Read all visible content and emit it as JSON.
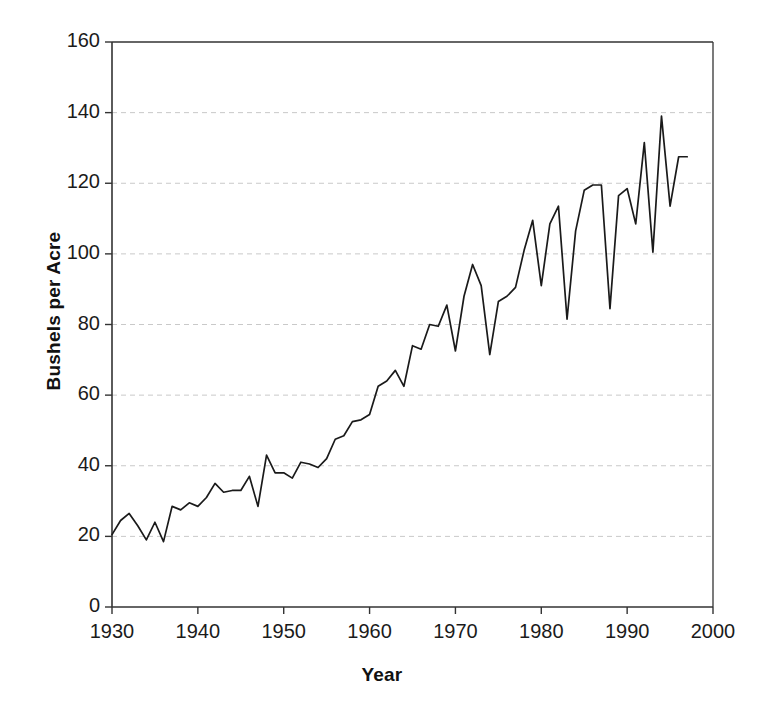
{
  "caption_fragment": "",
  "chart_data": {
    "type": "line",
    "title": "",
    "xlabel": "Year",
    "ylabel": "Bushels per Acre",
    "xlim": [
      1930,
      2000
    ],
    "ylim": [
      0,
      160
    ],
    "xticks": [
      1930,
      1940,
      1950,
      1960,
      1970,
      1980,
      1990,
      2000
    ],
    "yticks": [
      0,
      20,
      40,
      60,
      80,
      100,
      120,
      140,
      160
    ],
    "xtick_labels": [
      "1930",
      "1940",
      "1950",
      "1960",
      "1970",
      "1980",
      "1990",
      "2000"
    ],
    "ytick_labels": [
      "0",
      "20",
      "40",
      "60",
      "80",
      "100",
      "120",
      "140",
      "160"
    ],
    "grid": "horizontal-dashed",
    "legend": "none",
    "line_color": "#1a1a1a",
    "series": [
      {
        "name": "Corn yield",
        "x": [
          1930,
          1931,
          1932,
          1933,
          1934,
          1935,
          1936,
          1937,
          1938,
          1939,
          1940,
          1941,
          1942,
          1943,
          1944,
          1945,
          1946,
          1947,
          1948,
          1949,
          1950,
          1951,
          1952,
          1953,
          1954,
          1955,
          1956,
          1957,
          1958,
          1959,
          1960,
          1961,
          1962,
          1963,
          1964,
          1965,
          1966,
          1967,
          1968,
          1969,
          1970,
          1971,
          1972,
          1973,
          1974,
          1975,
          1976,
          1977,
          1978,
          1979,
          1980,
          1981,
          1982,
          1983,
          1984,
          1985,
          1986,
          1987,
          1988,
          1989,
          1990,
          1991,
          1992,
          1993,
          1994,
          1995,
          1996,
          1997
        ],
        "values": [
          20.5,
          24.5,
          26.5,
          23.0,
          19.0,
          24.0,
          18.5,
          28.5,
          27.5,
          29.5,
          28.5,
          31.0,
          35.0,
          32.5,
          33.0,
          33.0,
          37.0,
          28.5,
          43.0,
          38.0,
          38.0,
          36.5,
          41.0,
          40.5,
          39.5,
          42.0,
          47.5,
          48.5,
          52.5,
          53.0,
          54.5,
          62.5,
          64.0,
          67.0,
          62.5,
          74.0,
          73.0,
          80.0,
          79.5,
          85.5,
          72.5,
          88.0,
          97.0,
          91.0,
          71.5,
          86.5,
          88.0,
          90.5,
          101.0,
          109.5,
          91.0,
          108.5,
          113.5,
          81.5,
          106.5,
          118.0,
          119.5,
          119.5,
          84.5,
          116.5,
          118.5,
          108.5,
          131.5,
          100.5,
          139.0,
          113.5,
          127.5,
          127.5
        ]
      }
    ]
  }
}
